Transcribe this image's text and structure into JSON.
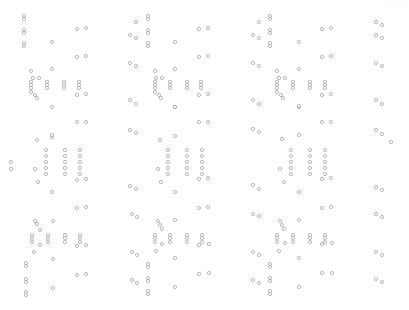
{
  "corner_label": "····· ····",
  "style": {
    "stroke": "#8a8a8a",
    "fill": "#ffffff",
    "radius": 1.6,
    "stroke_width": 0.6
  },
  "circles": [
    [
      24,
      16
    ],
    [
      24,
      19
    ],
    [
      24,
      30
    ],
    [
      24,
      33
    ],
    [
      24,
      43
    ],
    [
      24,
      46
    ],
    [
      77,
      29
    ],
    [
      86,
      28
    ],
    [
      52,
      42
    ],
    [
      77,
      57
    ],
    [
      86,
      56
    ],
    [
      52,
      69
    ],
    [
      31,
      71
    ],
    [
      33,
      78
    ],
    [
      39,
      78
    ],
    [
      31,
      82
    ],
    [
      31,
      85
    ],
    [
      31,
      88
    ],
    [
      47,
      82
    ],
    [
      47,
      85
    ],
    [
      47,
      88
    ],
    [
      64,
      82
    ],
    [
      64,
      85
    ],
    [
      64,
      88
    ],
    [
      79,
      82
    ],
    [
      79,
      85
    ],
    [
      79,
      88
    ],
    [
      31,
      92
    ],
    [
      35,
      95
    ],
    [
      37,
      98
    ],
    [
      77,
      95
    ],
    [
      86,
      94
    ],
    [
      52,
      107
    ],
    [
      148,
      16
    ],
    [
      148,
      19
    ],
    [
      136,
      22
    ],
    [
      148,
      30
    ],
    [
      148,
      33
    ],
    [
      130,
      35
    ],
    [
      136,
      38
    ],
    [
      148,
      43
    ],
    [
      148,
      46
    ],
    [
      175,
      42
    ],
    [
      199,
      29
    ],
    [
      208,
      28
    ],
    [
      130,
      63
    ],
    [
      136,
      66
    ],
    [
      199,
      57
    ],
    [
      208,
      56
    ],
    [
      175,
      69
    ],
    [
      155,
      71
    ],
    [
      156,
      78
    ],
    [
      162,
      78
    ],
    [
      155,
      82
    ],
    [
      155,
      85
    ],
    [
      155,
      88
    ],
    [
      170,
      82
    ],
    [
      170,
      85
    ],
    [
      170,
      88
    ],
    [
      187,
      82
    ],
    [
      187,
      85
    ],
    [
      187,
      88
    ],
    [
      201,
      82
    ],
    [
      201,
      85
    ],
    [
      201,
      88
    ],
    [
      155,
      92
    ],
    [
      159,
      95
    ],
    [
      161,
      98
    ],
    [
      199,
      95
    ],
    [
      208,
      94
    ],
    [
      130,
      100
    ],
    [
      136,
      104
    ],
    [
      175,
      107
    ],
    [
      270,
      16
    ],
    [
      270,
      19
    ],
    [
      270,
      30
    ],
    [
      270,
      33
    ],
    [
      270,
      43
    ],
    [
      270,
      46
    ],
    [
      259,
      22
    ],
    [
      253,
      35
    ],
    [
      259,
      38
    ],
    [
      299,
      42
    ],
    [
      322,
      29
    ],
    [
      331,
      28
    ],
    [
      253,
      63
    ],
    [
      259,
      66
    ],
    [
      322,
      57
    ],
    [
      331,
      56
    ],
    [
      299,
      69
    ],
    [
      277,
      71
    ],
    [
      279,
      78
    ],
    [
      285,
      78
    ],
    [
      277,
      82
    ],
    [
      277,
      85
    ],
    [
      277,
      88
    ],
    [
      293,
      82
    ],
    [
      293,
      85
    ],
    [
      293,
      88
    ],
    [
      310,
      82
    ],
    [
      310,
      85
    ],
    [
      310,
      88
    ],
    [
      325,
      82
    ],
    [
      325,
      85
    ],
    [
      325,
      88
    ],
    [
      277,
      92
    ],
    [
      281,
      95
    ],
    [
      283,
      98
    ],
    [
      322,
      95
    ],
    [
      331,
      94
    ],
    [
      253,
      100
    ],
    [
      259,
      104
    ],
    [
      299,
      107
    ],
    [
      376,
      22
    ],
    [
      382,
      25
    ],
    [
      376,
      35
    ],
    [
      382,
      38
    ],
    [
      376,
      63
    ],
    [
      382,
      66
    ],
    [
      376,
      100
    ],
    [
      382,
      104
    ],
    [
      391,
      142
    ],
    [
      376,
      130
    ],
    [
      382,
      134
    ],
    [
      52,
      137
    ],
    [
      77,
      122
    ],
    [
      86,
      122
    ],
    [
      52,
      135
    ],
    [
      37,
      140
    ],
    [
      46,
      150
    ],
    [
      46,
      156
    ],
    [
      46,
      162
    ],
    [
      46,
      168
    ],
    [
      46,
      174
    ],
    [
      65,
      150
    ],
    [
      65,
      156
    ],
    [
      65,
      162
    ],
    [
      65,
      168
    ],
    [
      65,
      174
    ],
    [
      80,
      150
    ],
    [
      80,
      156
    ],
    [
      80,
      162
    ],
    [
      80,
      168
    ],
    [
      80,
      174
    ],
    [
      35,
      169
    ],
    [
      11,
      162
    ],
    [
      11,
      169
    ],
    [
      38,
      182
    ],
    [
      52,
      192
    ],
    [
      77,
      180
    ],
    [
      86,
      179
    ],
    [
      77,
      208
    ],
    [
      86,
      207
    ],
    [
      175,
      107
    ],
    [
      160,
      140
    ],
    [
      175,
      136
    ],
    [
      130,
      130
    ],
    [
      136,
      133
    ],
    [
      199,
      122
    ],
    [
      208,
      122
    ],
    [
      168,
      150
    ],
    [
      168,
      156
    ],
    [
      168,
      162
    ],
    [
      168,
      168
    ],
    [
      168,
      174
    ],
    [
      187,
      150
    ],
    [
      187,
      156
    ],
    [
      187,
      162
    ],
    [
      187,
      168
    ],
    [
      187,
      174
    ],
    [
      202,
      150
    ],
    [
      202,
      156
    ],
    [
      202,
      162
    ],
    [
      202,
      168
    ],
    [
      202,
      174
    ],
    [
      158,
      169
    ],
    [
      161,
      182
    ],
    [
      175,
      192
    ],
    [
      130,
      186
    ],
    [
      136,
      189
    ],
    [
      199,
      179
    ],
    [
      208,
      178
    ],
    [
      199,
      208
    ],
    [
      208,
      207
    ],
    [
      299,
      106
    ],
    [
      282,
      139
    ],
    [
      299,
      135
    ],
    [
      253,
      129
    ],
    [
      259,
      132
    ],
    [
      322,
      122
    ],
    [
      331,
      122
    ],
    [
      291,
      150
    ],
    [
      291,
      156
    ],
    [
      291,
      162
    ],
    [
      291,
      168
    ],
    [
      291,
      174
    ],
    [
      310,
      150
    ],
    [
      310,
      156
    ],
    [
      310,
      162
    ],
    [
      310,
      168
    ],
    [
      310,
      174
    ],
    [
      325,
      150
    ],
    [
      325,
      156
    ],
    [
      325,
      162
    ],
    [
      325,
      168
    ],
    [
      325,
      174
    ],
    [
      280,
      169
    ],
    [
      284,
      182
    ],
    [
      299,
      192
    ],
    [
      253,
      185
    ],
    [
      259,
      189
    ],
    [
      322,
      179
    ],
    [
      331,
      178
    ],
    [
      322,
      208
    ],
    [
      331,
      207
    ],
    [
      376,
      187
    ],
    [
      382,
      190
    ],
    [
      376,
      214
    ],
    [
      382,
      217
    ],
    [
      376,
      252
    ],
    [
      382,
      255
    ],
    [
      376,
      279
    ],
    [
      382,
      282
    ],
    [
      35,
      221
    ],
    [
      37,
      224
    ],
    [
      40,
      230
    ],
    [
      53,
      221
    ],
    [
      32,
      235
    ],
    [
      32,
      238
    ],
    [
      32,
      242
    ],
    [
      48,
      235
    ],
    [
      48,
      238
    ],
    [
      48,
      242
    ],
    [
      65,
      235
    ],
    [
      65,
      238
    ],
    [
      65,
      242
    ],
    [
      80,
      235
    ],
    [
      80,
      238
    ],
    [
      80,
      242
    ],
    [
      40,
      245
    ],
    [
      34,
      252
    ],
    [
      77,
      246
    ],
    [
      86,
      245
    ],
    [
      53,
      259
    ],
    [
      26,
      263
    ],
    [
      26,
      266
    ],
    [
      26,
      279
    ],
    [
      26,
      282
    ],
    [
      26,
      292
    ],
    [
      26,
      295
    ],
    [
      77,
      275
    ],
    [
      86,
      274
    ],
    [
      53,
      288
    ],
    [
      132,
      214
    ],
    [
      137,
      217
    ],
    [
      158,
      221
    ],
    [
      160,
      225
    ],
    [
      162,
      229
    ],
    [
      175,
      220
    ],
    [
      155,
      235
    ],
    [
      155,
      238
    ],
    [
      155,
      242
    ],
    [
      170,
      235
    ],
    [
      170,
      238
    ],
    [
      170,
      242
    ],
    [
      187,
      235
    ],
    [
      187,
      238
    ],
    [
      187,
      242
    ],
    [
      202,
      235
    ],
    [
      202,
      238
    ],
    [
      202,
      242
    ],
    [
      162,
      244
    ],
    [
      156,
      251
    ],
    [
      132,
      252
    ],
    [
      137,
      255
    ],
    [
      199,
      245
    ],
    [
      209,
      244
    ],
    [
      175,
      258
    ],
    [
      148,
      264
    ],
    [
      148,
      267
    ],
    [
      148,
      278
    ],
    [
      148,
      281
    ],
    [
      132,
      280
    ],
    [
      137,
      283
    ],
    [
      148,
      291
    ],
    [
      148,
      294
    ],
    [
      175,
      287
    ],
    [
      199,
      274
    ],
    [
      209,
      273
    ],
    [
      253,
      214
    ],
    [
      259,
      216
    ],
    [
      280,
      221
    ],
    [
      282,
      225
    ],
    [
      284,
      229
    ],
    [
      299,
      220
    ],
    [
      277,
      235
    ],
    [
      277,
      238
    ],
    [
      277,
      242
    ],
    [
      293,
      235
    ],
    [
      293,
      238
    ],
    [
      293,
      242
    ],
    [
      310,
      235
    ],
    [
      310,
      238
    ],
    [
      310,
      242
    ],
    [
      325,
      235
    ],
    [
      325,
      238
    ],
    [
      325,
      242
    ],
    [
      285,
      243
    ],
    [
      279,
      251
    ],
    [
      253,
      252
    ],
    [
      259,
      255
    ],
    [
      322,
      244
    ],
    [
      332,
      243
    ],
    [
      299,
      258
    ],
    [
      270,
      264
    ],
    [
      270,
      267
    ],
    [
      270,
      278
    ],
    [
      270,
      281
    ],
    [
      253,
      280
    ],
    [
      259,
      283
    ],
    [
      270,
      291
    ],
    [
      270,
      294
    ],
    [
      299,
      287
    ],
    [
      322,
      273
    ],
    [
      332,
      273
    ]
  ]
}
